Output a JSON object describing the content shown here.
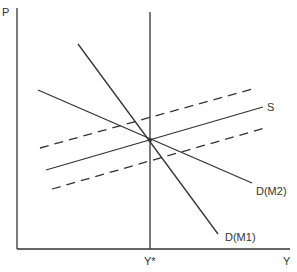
{
  "diagram": {
    "axes": {
      "y_label": "P",
      "x_label": "Y",
      "x_marker_label": "Y*"
    },
    "curves": [
      {
        "id": "S",
        "label": "S",
        "style": "solid"
      },
      {
        "id": "D_M1",
        "label": "D(M1)",
        "style": "solid"
      },
      {
        "id": "D_M2",
        "label": "D(M2)",
        "style": "solid"
      },
      {
        "id": "S_upper",
        "label": "",
        "style": "dashed"
      },
      {
        "id": "S_lower",
        "label": "",
        "style": "dashed"
      }
    ],
    "colors": {
      "line": "#333333",
      "background": "#ffffff"
    }
  }
}
